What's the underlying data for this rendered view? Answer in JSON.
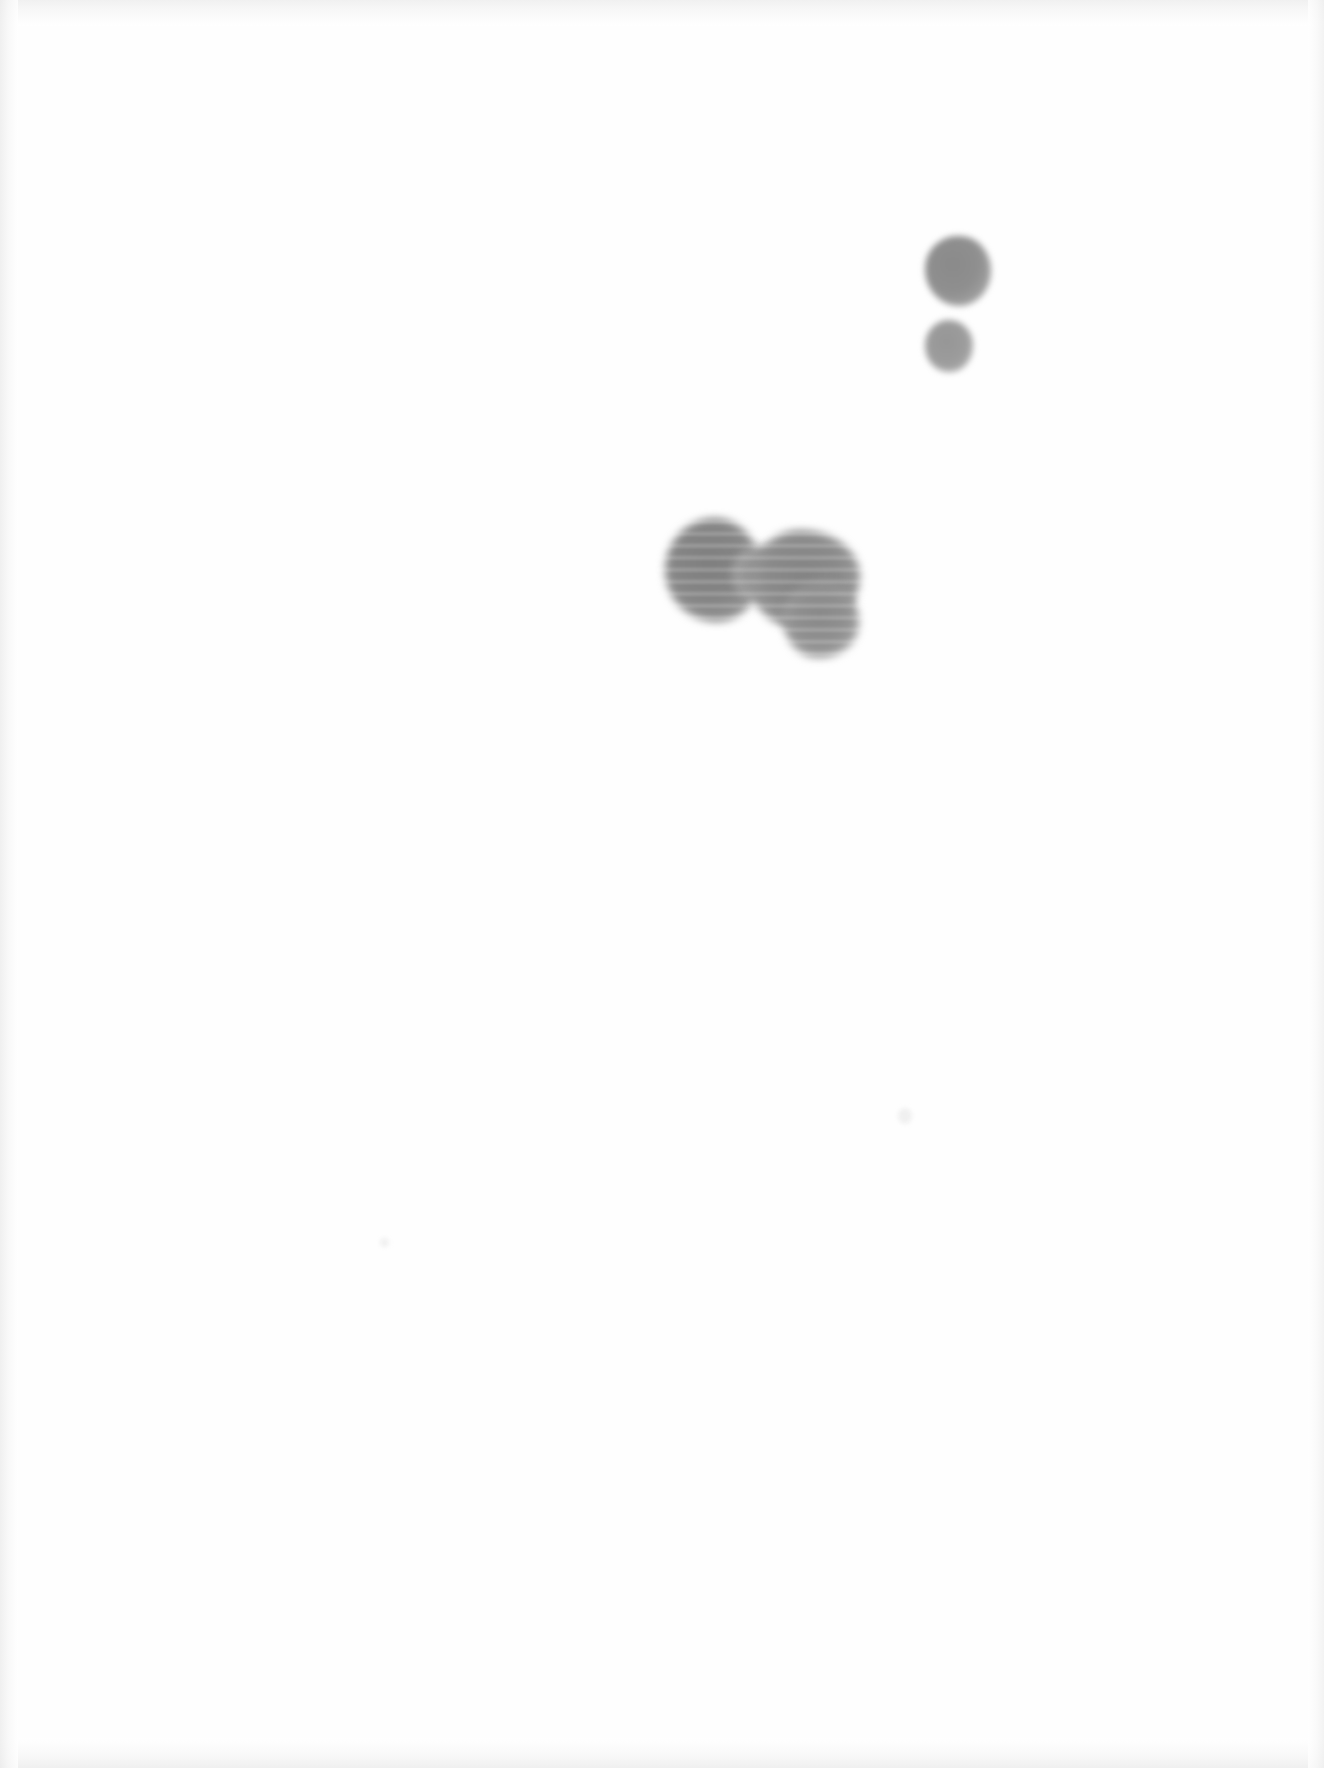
{
  "page": {
    "kind": "scanned-document-page",
    "width": 1324,
    "height": 1768,
    "background_color": "#ffffff",
    "paper_color": "#fefefe",
    "has_text": false,
    "has_visible_ui": false
  },
  "edge_vignette": {
    "present": true,
    "color": "#ededed",
    "edges": [
      "top",
      "bottom",
      "left",
      "right"
    ]
  },
  "marks": [
    {
      "id": "blob-upper-large",
      "label": "large upper-right round blob",
      "shape": "circle",
      "center_x": 958,
      "center_y": 271,
      "width": 66,
      "height": 70,
      "fill_color": "#8f8f8f",
      "edge": "soft-blurred",
      "tone": "medium-grey"
    },
    {
      "id": "blob-upper-small",
      "label": "small round blob below the large one",
      "shape": "circle",
      "center_x": 949,
      "center_y": 346,
      "width": 48,
      "height": 52,
      "fill_color": "#9c9c9c",
      "edge": "soft-blurred",
      "tone": "light-medium-grey"
    },
    {
      "id": "blob-cluster-left-lobe",
      "label": "left lobe of central double blob",
      "shape": "rounded-irregular",
      "center_x": 713,
      "center_y": 570,
      "width": 96,
      "height": 104,
      "fill_color": "#858585",
      "edge": "soft-blurred",
      "tone": "dark-grey",
      "texture": "horizontal-scan-banding"
    },
    {
      "id": "blob-cluster-right-lobe",
      "label": "right lobe of central double blob",
      "shape": "rounded-irregular",
      "center_x": 805,
      "center_y": 580,
      "width": 110,
      "height": 100,
      "fill_color": "#8a8a8a",
      "edge": "soft-blurred",
      "tone": "dark-grey",
      "texture": "horizontal-scan-banding"
    },
    {
      "id": "blob-cluster-tail",
      "label": "lower-right extension of the right lobe",
      "shape": "rounded-irregular",
      "center_x": 821,
      "center_y": 620,
      "width": 76,
      "height": 76,
      "fill_color": "#909090",
      "edge": "soft-blurred",
      "tone": "medium-grey"
    },
    {
      "id": "speck-mid",
      "label": "faint speck near page middle",
      "shape": "speck",
      "center_x": 905,
      "center_y": 1116,
      "width": 14,
      "height": 16,
      "fill_color": "#f0f0f0",
      "edge": "soft-blurred",
      "tone": "near-white"
    },
    {
      "id": "speck-lower",
      "label": "faint speck lower-left quadrant",
      "shape": "speck",
      "center_x": 385,
      "center_y": 1243,
      "width": 9,
      "height": 9,
      "fill_color": "#f2f2f2",
      "edge": "soft-blurred",
      "tone": "near-white"
    }
  ]
}
